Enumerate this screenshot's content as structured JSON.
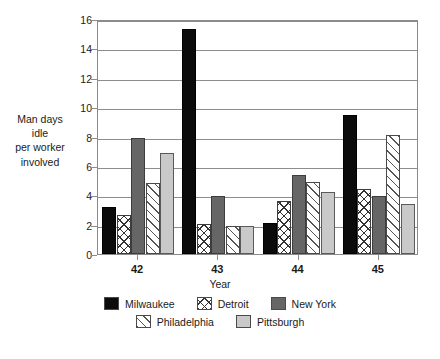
{
  "chart_data": {
    "type": "bar",
    "title": "",
    "xlabel": "Year",
    "ylabel": "Man days idle per worker involved",
    "ylabel_lines": [
      "Man days",
      "idle",
      "per worker",
      "involved"
    ],
    "categories": [
      "42",
      "43",
      "44",
      "45"
    ],
    "ylim": [
      0,
      16
    ],
    "yticks": [
      0,
      2,
      4,
      6,
      8,
      10,
      12,
      14,
      16
    ],
    "ytick_labels": [
      "0",
      "2",
      "4",
      "6",
      "8",
      "10",
      "12",
      "14",
      "16"
    ],
    "grid": true,
    "legend_position": "bottom",
    "series": [
      {
        "name": "Milwaukee",
        "pattern": "solid-black",
        "color": "#0b0b0b",
        "values": [
          3.2,
          15.3,
          2.1,
          9.45
        ]
      },
      {
        "name": "Detroit",
        "pattern": "cross-hatch",
        "color": "#ffffff",
        "values": [
          2.65,
          2.05,
          3.6,
          4.4
        ]
      },
      {
        "name": "New York",
        "pattern": "solid-gray",
        "color": "#666666",
        "values": [
          7.9,
          3.95,
          5.4,
          3.95
        ]
      },
      {
        "name": "Philadelphia",
        "pattern": "diagonal-hatch",
        "color": "#ffffff",
        "values": [
          4.83,
          1.9,
          4.9,
          8.1
        ]
      },
      {
        "name": "Pittsburgh",
        "pattern": "solid-lightgray",
        "color": "#c9c9c9",
        "values": [
          6.9,
          1.9,
          4.2,
          3.4
        ]
      }
    ]
  },
  "legend": {
    "row1": [
      "Milwaukee",
      "Detroit",
      "New York"
    ],
    "row2": [
      "Philadelphia",
      "Pittsburgh"
    ]
  }
}
